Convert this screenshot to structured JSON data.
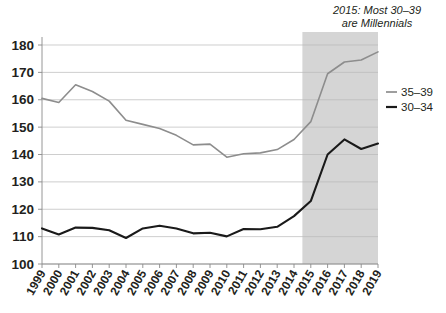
{
  "chart_data": {
    "type": "line",
    "title": "",
    "xlabel": "",
    "ylabel": "",
    "x": [
      1999,
      2000,
      2001,
      2002,
      2003,
      2004,
      2005,
      2006,
      2007,
      2008,
      2009,
      2010,
      2011,
      2012,
      2013,
      2014,
      2015,
      2016,
      2017,
      2018,
      2019
    ],
    "categories": [
      "1999",
      "2000",
      "2001",
      "2002",
      "2003",
      "2004",
      "2005",
      "2006",
      "2007",
      "2008",
      "2009",
      "2010",
      "2011",
      "2012",
      "2013",
      "2014",
      "2015",
      "2016",
      "2017",
      "2018",
      "2019"
    ],
    "series": [
      {
        "name": "35–39",
        "color": "#8d8d8d",
        "values": [
          160.5,
          159.0,
          165.5,
          163.0,
          159.5,
          152.5,
          151.0,
          149.5,
          147.0,
          143.5,
          143.8,
          139.0,
          140.3,
          140.6,
          141.8,
          145.5,
          152.0,
          169.5,
          173.8,
          174.5,
          177.5
        ]
      },
      {
        "name": "30–34",
        "color": "#1a1a1a",
        "values": [
          113.0,
          110.8,
          113.3,
          113.2,
          112.3,
          109.5,
          113.0,
          114.0,
          113.0,
          111.2,
          111.4,
          110.1,
          112.8,
          112.7,
          113.6,
          117.5,
          123.0,
          140.0,
          145.5,
          142.0,
          144.0
        ]
      }
    ],
    "ylim": [
      100,
      180
    ],
    "yticks": [
      100,
      110,
      120,
      130,
      140,
      150,
      160,
      170,
      180
    ],
    "ytick_labels": [
      "100",
      "110",
      "120",
      "130",
      "140",
      "150",
      "160",
      "170",
      "180"
    ],
    "grid": true,
    "legend_position": "right",
    "annotations": [
      {
        "name": "millennials-note",
        "line1": "2015: Most 30–39",
        "line2": "are Millennials",
        "style": "italic"
      }
    ],
    "shaded_region": {
      "label": "2015-2019 highlight band",
      "x_start": 2014.5,
      "x_end": 2019,
      "color": "#d5d5d5"
    }
  },
  "legend": {
    "items": [
      {
        "label": "35–39",
        "color": "#8d8d8d"
      },
      {
        "label": "30–34",
        "color": "#1a1a1a"
      }
    ]
  },
  "colors": {
    "background": "#ffffff",
    "grid": "#b9b9b9",
    "axis": "#8a8a8a",
    "shade": "#d5d5d5",
    "series_35_39": "#8d8d8d",
    "series_30_34": "#1a1a1a",
    "text": "#231f20"
  }
}
